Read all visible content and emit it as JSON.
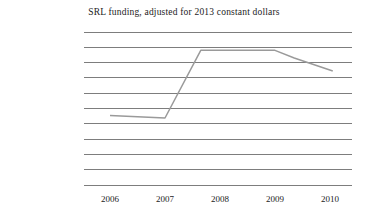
{
  "chart_data": {
    "type": "line",
    "title": "SRL funding, adjusted for 2013 constant dollars",
    "xlabel": "",
    "ylabel": "",
    "x_tick_labels": [
      "2006",
      "2007",
      "2008",
      "2009",
      "2010"
    ],
    "x_tick_values": [
      2006,
      2007,
      2008,
      2009,
      2010
    ],
    "xlim": [
      2005.6,
      2010.4
    ],
    "ylim": [
      0,
      100000000
    ],
    "y_tick_labels": [
      "$-",
      "$10,000,000.00",
      "$20,000,000.00",
      "$30,000,000.00",
      "$40,000,000.00",
      "$50,000,000.00",
      "$60,000,000.00",
      "$70,000,000.00",
      "$80,000,000.00",
      "$90,000,000.00",
      "$100,000,000.00"
    ],
    "y_tick_values": [
      0,
      10000000,
      20000000,
      30000000,
      40000000,
      50000000,
      60000000,
      70000000,
      80000000,
      90000000,
      100000000
    ],
    "grid": "horizontal",
    "legend": "none",
    "series": [
      {
        "name": "SRL funding",
        "color": "#9a9a9a",
        "x": [
          2006.0,
          2007.0,
          2007.65,
          2008.0,
          2009.0,
          2009.35,
          2010.05
        ],
        "values": [
          45500000,
          43800000,
          88000000,
          88000000,
          88000000,
          83000000,
          74500000
        ]
      }
    ]
  },
  "axis_style": {
    "grid_color": "#6f6f6f",
    "line_color": "#9a9a9a",
    "text_color": "#1c1c1c"
  }
}
